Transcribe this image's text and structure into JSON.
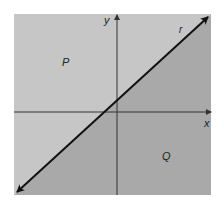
{
  "diagram": {
    "type": "coordinate-plane-half-planes",
    "colors": {
      "background": "#ffffff",
      "region_P": "#c6c6c6",
      "region_Q": "#a9a9a9",
      "axis": "#333333",
      "line": "#111111",
      "text": "#222222"
    },
    "box": {
      "x1": 14,
      "y1": 14,
      "x2": 211,
      "y2": 195
    },
    "axes": {
      "x_axis_y": 112,
      "y_axis_x": 117,
      "x_label": "x",
      "y_label": "y"
    },
    "line": {
      "name": "r",
      "label": "r",
      "start": {
        "x": 15,
        "y": 194
      },
      "end": {
        "x": 210,
        "y": 15
      },
      "arrowheads": "both"
    },
    "regions": [
      {
        "name": "P",
        "label": "P",
        "position": "above-left of line r",
        "shade": "light"
      },
      {
        "name": "Q",
        "label": "Q",
        "position": "below-right of line r",
        "shade": "dark"
      }
    ]
  }
}
